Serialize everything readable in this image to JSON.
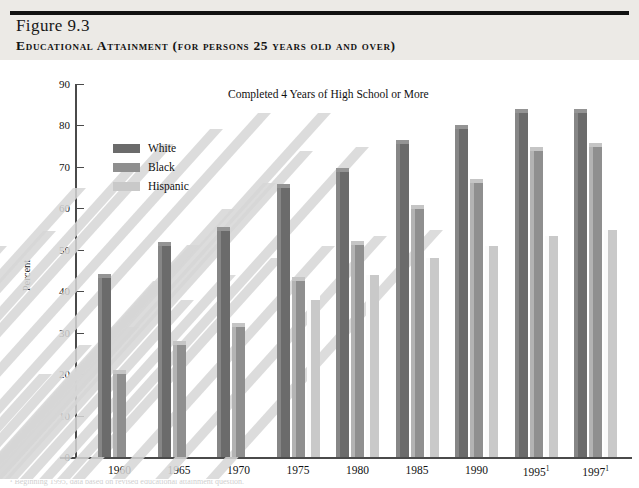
{
  "header": {
    "figure_number": "Figure 9.3",
    "figure_number_drop_cap": "F",
    "figure_number_rest": "igure 9.3",
    "title": "Educational Attainment (for persons 25 years old and over)"
  },
  "chart_data": {
    "type": "bar",
    "title": "Educational Attainment (for persons 25 years old and over)",
    "subtitle": "Completed 4 Years of High School or More",
    "xlabel": "",
    "ylabel": "Percent",
    "ylim": [
      0,
      90
    ],
    "ytick_step": 10,
    "yticks": [
      0,
      10,
      20,
      30,
      40,
      50,
      60,
      70,
      80,
      90
    ],
    "grid": false,
    "legend_position": "upper-left-inside",
    "categories": [
      "1960",
      "1965",
      "1970",
      "1975",
      "1980",
      "1985",
      "1990",
      "1995¹",
      "1997¹"
    ],
    "series": [
      {
        "name": "White",
        "color": "#6b6b6b",
        "values": [
          43.2,
          51.0,
          54.5,
          65.0,
          68.8,
          75.5,
          79.1,
          83.0,
          82.9
        ]
      },
      {
        "name": "Black",
        "color": "#8f8f8f",
        "values": [
          20.1,
          27.0,
          31.4,
          42.5,
          51.2,
          59.8,
          66.2,
          73.8,
          74.9
        ]
      },
      {
        "name": "Hispanic",
        "color": "#c9c9c9",
        "values": [
          null,
          null,
          null,
          37.9,
          44.0,
          47.9,
          50.8,
          53.4,
          54.7
        ]
      }
    ]
  },
  "legend": {
    "items": [
      {
        "label": "White",
        "color": "#6b6b6b"
      },
      {
        "label": "Black",
        "color": "#8f8f8f"
      },
      {
        "label": "Hispanic",
        "color": "#c9c9c9"
      }
    ]
  },
  "axis": {
    "y_title": "Percent"
  },
  "colors": {
    "header_band": "#eceae6",
    "rule": "#111111",
    "axis": "#4a4a4a",
    "white_series": "#6b6b6b",
    "black_series": "#8f8f8f",
    "hispanic_series": "#c9c9c9",
    "shadow": "#d6d6d6"
  },
  "footnote": {
    "text": "¹ Beginning 1995, data based on revised educational attainment question."
  }
}
